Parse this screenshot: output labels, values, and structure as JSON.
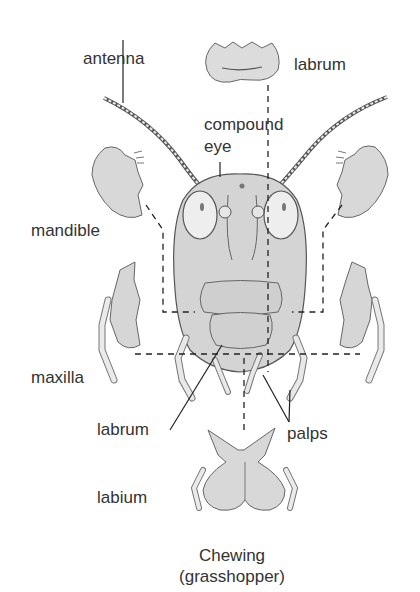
{
  "diagram": {
    "labels": {
      "antenna": "antenna",
      "labrum_top": "labrum",
      "compound_eye_line1": "compound",
      "compound_eye_line2": "eye",
      "mandible": "mandible",
      "maxilla": "maxilla",
      "labrum_bottom": "labrum",
      "palps": "palps",
      "labium": "labium"
    },
    "caption": {
      "line1": "Chewing",
      "line2": "(grasshopper)"
    },
    "colors": {
      "part_fill": "#d9d9d9",
      "outline": "#555555",
      "leader_line": "#222222",
      "text": "#333333"
    }
  }
}
